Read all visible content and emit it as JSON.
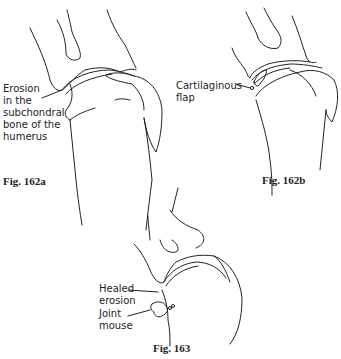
{
  "figures": [
    {
      "id": "162a",
      "caption": "Fig. 162a",
      "annotations": [
        {
          "text": "Erosion\nin the\nsubchondral\nbone of the\nhumerus"
        }
      ]
    },
    {
      "id": "162b",
      "caption": "Fig. 162b",
      "annotations": [
        {
          "text": "Cartilaginous\nflap"
        }
      ]
    },
    {
      "id": "163",
      "caption": "Fig. 163",
      "annotations": [
        {
          "text": "Healed\nerosion"
        },
        {
          "text": "Joint\nmouse"
        }
      ]
    }
  ],
  "colors": {
    "line": "#222222",
    "background": "#ffffff"
  }
}
